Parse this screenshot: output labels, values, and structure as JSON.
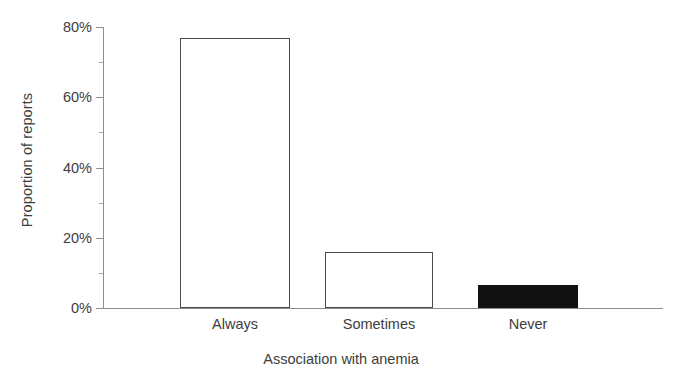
{
  "chart_data": {
    "type": "bar",
    "title": "",
    "subtitle": "",
    "xlabel": "Association with anemia",
    "ylabel": "Proportion of reports",
    "categories": [
      "Always",
      "Sometimes",
      "Never"
    ],
    "values": [
      77,
      16,
      6.5
    ],
    "value_unit": "percent",
    "ylim": [
      0,
      80
    ],
    "ytick_labels": [
      "0%",
      "20%",
      "40%",
      "60%",
      "80%"
    ],
    "ytick_values": [
      0,
      20,
      40,
      60,
      80
    ],
    "yminor_tick_values": [
      10,
      30,
      50,
      70
    ],
    "grid": false,
    "legend": null,
    "legend_position": "none",
    "series": [
      {
        "name": "Proportion of reports",
        "values": [
          77,
          16,
          6.5
        ],
        "bar_styles": [
          "open",
          "open",
          "filled"
        ]
      }
    ],
    "colors": {
      "bar_outline": "#4a4a4a",
      "bar_open_fill": "#ffffff",
      "bar_filled_fill": "#111111",
      "axis": "#8e8e8e",
      "text": "#3d3d3d",
      "background": "#ffffff"
    }
  },
  "axes": {
    "y_ticks": [
      {
        "label": "80%",
        "value": 80
      },
      {
        "label": "60%",
        "value": 60
      },
      {
        "label": "40%",
        "value": 40
      },
      {
        "label": "20%",
        "value": 20
      },
      {
        "label": "0%",
        "value": 0
      }
    ],
    "x_ticks": [
      {
        "label": "Always"
      },
      {
        "label": "Sometimes"
      },
      {
        "label": "Never"
      }
    ]
  }
}
